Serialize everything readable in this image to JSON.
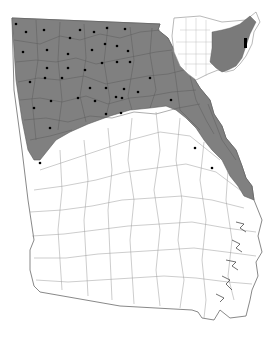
{
  "map": {
    "title": "",
    "region": "Georgia",
    "shaded_fill": "#808080",
    "unshaded_fill": "#ffffff",
    "border_color": "#5a5a5a",
    "dot_color": "#000000",
    "inset": {
      "region": "United States",
      "shaded_fill": "#7a7a7a",
      "highlight_fill": "#000000"
    }
  }
}
